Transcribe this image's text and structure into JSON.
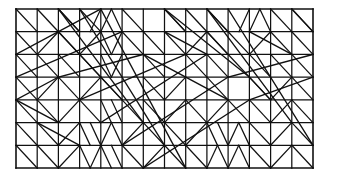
{
  "figure": {
    "type": "mesh-diagram"
  },
  "canvas": {
    "width": 338,
    "height": 179,
    "background": "#ffffff"
  },
  "style": {
    "line_color": "#111111",
    "border_color": "#111111",
    "border_width": 1.6,
    "grid_width": 1.25,
    "diagonal_width": 1.25,
    "chord_width": 1.35
  },
  "domain": {
    "x0": 16,
    "y0": 9,
    "x1": 313,
    "y1": 168,
    "columns": 14,
    "rows": 7,
    "cell_width": 21.21,
    "cell_height": 22.71
  },
  "grid": {
    "vertical_x": [
      16,
      37.2,
      58.4,
      79.6,
      100.8,
      122.1,
      143.3,
      164.5,
      185.7,
      206.9,
      228.1,
      249.4,
      270.6,
      291.8,
      313
    ],
    "horizontal_y": [
      9,
      31.7,
      54.4,
      77.1,
      99.9,
      122.6,
      145.3,
      168
    ]
  },
  "chart_data": {
    "type": "diagram",
    "node_count": 120,
    "cell_count": 98,
    "segments": {
      "border": [
        {
          "x1": 16,
          "y1": 9,
          "x2": 313,
          "y2": 9
        },
        {
          "x1": 313,
          "y1": 9,
          "x2": 313,
          "y2": 168
        },
        {
          "x1": 313,
          "y1": 168,
          "x2": 16,
          "y2": 168
        },
        {
          "x1": 16,
          "y1": 168,
          "x2": 16,
          "y2": 9
        }
      ],
      "grid_vertical": [
        {
          "x1": 37.2,
          "y1": 9,
          "x2": 37.2,
          "y2": 168
        },
        {
          "x1": 58.4,
          "y1": 9,
          "x2": 58.4,
          "y2": 168
        },
        {
          "x1": 79.6,
          "y1": 9,
          "x2": 79.6,
          "y2": 168
        },
        {
          "x1": 100.8,
          "y1": 9,
          "x2": 100.8,
          "y2": 168
        },
        {
          "x1": 122.1,
          "y1": 9,
          "x2": 122.1,
          "y2": 168
        },
        {
          "x1": 143.3,
          "y1": 9,
          "x2": 143.3,
          "y2": 168
        },
        {
          "x1": 164.5,
          "y1": 9,
          "x2": 164.5,
          "y2": 168
        },
        {
          "x1": 185.7,
          "y1": 9,
          "x2": 185.7,
          "y2": 168
        },
        {
          "x1": 206.9,
          "y1": 9,
          "x2": 206.9,
          "y2": 168
        },
        {
          "x1": 228.1,
          "y1": 9,
          "x2": 228.1,
          "y2": 168
        },
        {
          "x1": 249.4,
          "y1": 9,
          "x2": 249.4,
          "y2": 168
        },
        {
          "x1": 270.6,
          "y1": 9,
          "x2": 270.6,
          "y2": 168
        },
        {
          "x1": 291.8,
          "y1": 9,
          "x2": 291.8,
          "y2": 168
        }
      ],
      "grid_horizontal": [
        {
          "x1": 16,
          "y1": 31.7,
          "x2": 313,
          "y2": 31.7
        },
        {
          "x1": 16,
          "y1": 54.4,
          "x2": 313,
          "y2": 54.4
        },
        {
          "x1": 16,
          "y1": 77.1,
          "x2": 313,
          "y2": 77.1
        },
        {
          "x1": 16,
          "y1": 99.9,
          "x2": 313,
          "y2": 99.9
        },
        {
          "x1": 16,
          "y1": 122.6,
          "x2": 313,
          "y2": 122.6
        },
        {
          "x1": 16,
          "y1": 145.3,
          "x2": 313,
          "y2": 145.3
        }
      ],
      "cell_diagonals": [
        {
          "x1": 16,
          "y1": 9,
          "x2": 37.2,
          "y2": 31.7
        },
        {
          "x1": 58.4,
          "y1": 9,
          "x2": 79.6,
          "y2": 31.7
        },
        {
          "x1": 79.6,
          "y1": 31.7,
          "x2": 58.4,
          "y2": 9
        },
        {
          "x1": 79.6,
          "y1": 9,
          "x2": 100.8,
          "y2": 31.7
        },
        {
          "x1": 100.8,
          "y1": 9,
          "x2": 90.2,
          "y2": 31.7
        },
        {
          "x1": 100.8,
          "y1": 31.7,
          "x2": 111.4,
          "y2": 9
        },
        {
          "x1": 111.4,
          "y1": 9,
          "x2": 122.1,
          "y2": 31.7
        },
        {
          "x1": 122.1,
          "y1": 9,
          "x2": 143.3,
          "y2": 31.7
        },
        {
          "x1": 164.5,
          "y1": 9,
          "x2": 185.7,
          "y2": 31.7
        },
        {
          "x1": 185.7,
          "y1": 31.7,
          "x2": 164.5,
          "y2": 9
        },
        {
          "x1": 206.9,
          "y1": 9,
          "x2": 228.1,
          "y2": 31.7
        },
        {
          "x1": 228.1,
          "y1": 31.7,
          "x2": 206.9,
          "y2": 9
        },
        {
          "x1": 249.4,
          "y1": 9,
          "x2": 239,
          "y2": 31.7
        },
        {
          "x1": 249.4,
          "y1": 31.7,
          "x2": 259.8,
          "y2": 9
        },
        {
          "x1": 259.8,
          "y1": 9,
          "x2": 270.6,
          "y2": 31.7
        },
        {
          "x1": 270.6,
          "y1": 9,
          "x2": 291.8,
          "y2": 31.7
        },
        {
          "x1": 291.8,
          "y1": 9,
          "x2": 313,
          "y2": 31.7
        },
        {
          "x1": 313,
          "y1": 31.7,
          "x2": 291.8,
          "y2": 9
        },
        {
          "x1": 16,
          "y1": 31.7,
          "x2": 37.2,
          "y2": 54.4
        },
        {
          "x1": 37.2,
          "y1": 54.4,
          "x2": 58.4,
          "y2": 31.7
        },
        {
          "x1": 58.4,
          "y1": 31.7,
          "x2": 79.6,
          "y2": 54.4
        },
        {
          "x1": 79.6,
          "y1": 54.4,
          "x2": 100.8,
          "y2": 31.7
        },
        {
          "x1": 100.8,
          "y1": 31.7,
          "x2": 111.4,
          "y2": 54.4
        },
        {
          "x1": 111.4,
          "y1": 54.4,
          "x2": 122.1,
          "y2": 31.7
        },
        {
          "x1": 122.1,
          "y1": 31.7,
          "x2": 143.3,
          "y2": 54.4
        },
        {
          "x1": 143.3,
          "y1": 31.7,
          "x2": 164.5,
          "y2": 54.4
        },
        {
          "x1": 164.5,
          "y1": 31.7,
          "x2": 185.7,
          "y2": 54.4
        },
        {
          "x1": 185.7,
          "y1": 54.4,
          "x2": 206.9,
          "y2": 31.7
        },
        {
          "x1": 206.9,
          "y1": 31.7,
          "x2": 228.1,
          "y2": 54.4
        },
        {
          "x1": 228.1,
          "y1": 31.7,
          "x2": 249.4,
          "y2": 54.4
        },
        {
          "x1": 249.4,
          "y1": 54.4,
          "x2": 270.6,
          "y2": 31.7
        },
        {
          "x1": 270.6,
          "y1": 31.7,
          "x2": 291.8,
          "y2": 54.4
        },
        {
          "x1": 291.8,
          "y1": 31.7,
          "x2": 313,
          "y2": 54.4
        },
        {
          "x1": 16,
          "y1": 54.4,
          "x2": 37.2,
          "y2": 77.1
        },
        {
          "x1": 37.2,
          "y1": 54.4,
          "x2": 58.4,
          "y2": 77.1
        },
        {
          "x1": 58.4,
          "y1": 54.4,
          "x2": 79.6,
          "y2": 77.1
        },
        {
          "x1": 79.6,
          "y1": 54.4,
          "x2": 100.8,
          "y2": 77.1
        },
        {
          "x1": 100.8,
          "y1": 54.4,
          "x2": 111.4,
          "y2": 77.1
        },
        {
          "x1": 111.4,
          "y1": 77.1,
          "x2": 122.1,
          "y2": 54.4
        },
        {
          "x1": 143.3,
          "y1": 54.4,
          "x2": 164.5,
          "y2": 77.1
        },
        {
          "x1": 185.7,
          "y1": 54.4,
          "x2": 206.9,
          "y2": 77.1
        },
        {
          "x1": 206.9,
          "y1": 54.4,
          "x2": 228.1,
          "y2": 77.1
        },
        {
          "x1": 249.4,
          "y1": 54.4,
          "x2": 270.6,
          "y2": 77.1
        },
        {
          "x1": 270.6,
          "y1": 54.4,
          "x2": 291.8,
          "y2": 77.1
        },
        {
          "x1": 291.8,
          "y1": 54.4,
          "x2": 313,
          "y2": 77.1
        },
        {
          "x1": 16,
          "y1": 77.1,
          "x2": 37.2,
          "y2": 99.9
        },
        {
          "x1": 37.2,
          "y1": 99.9,
          "x2": 58.4,
          "y2": 77.1
        },
        {
          "x1": 58.4,
          "y1": 77.1,
          "x2": 79.6,
          "y2": 99.9
        },
        {
          "x1": 79.6,
          "y1": 99.9,
          "x2": 100.8,
          "y2": 77.1
        },
        {
          "x1": 100.8,
          "y1": 77.1,
          "x2": 122.1,
          "y2": 99.9
        },
        {
          "x1": 143.3,
          "y1": 77.1,
          "x2": 164.5,
          "y2": 99.9
        },
        {
          "x1": 164.5,
          "y1": 99.9,
          "x2": 185.7,
          "y2": 77.1
        },
        {
          "x1": 206.9,
          "y1": 77.1,
          "x2": 228.1,
          "y2": 99.9
        },
        {
          "x1": 249.4,
          "y1": 77.1,
          "x2": 270.6,
          "y2": 99.9
        },
        {
          "x1": 270.6,
          "y1": 99.9,
          "x2": 291.8,
          "y2": 77.1
        },
        {
          "x1": 291.8,
          "y1": 77.1,
          "x2": 313,
          "y2": 99.9
        },
        {
          "x1": 16,
          "y1": 99.9,
          "x2": 37.2,
          "y2": 122.6
        },
        {
          "x1": 37.2,
          "y1": 99.9,
          "x2": 58.4,
          "y2": 122.6
        },
        {
          "x1": 58.4,
          "y1": 122.6,
          "x2": 79.6,
          "y2": 99.9
        },
        {
          "x1": 79.6,
          "y1": 99.9,
          "x2": 100.8,
          "y2": 122.6
        },
        {
          "x1": 100.8,
          "y1": 99.9,
          "x2": 111.4,
          "y2": 122.6
        },
        {
          "x1": 111.4,
          "y1": 99.9,
          "x2": 122.1,
          "y2": 122.6
        },
        {
          "x1": 122.1,
          "y1": 99.9,
          "x2": 143.3,
          "y2": 122.6
        },
        {
          "x1": 143.3,
          "y1": 99.9,
          "x2": 164.5,
          "y2": 122.6
        },
        {
          "x1": 164.5,
          "y1": 122.6,
          "x2": 185.7,
          "y2": 99.9
        },
        {
          "x1": 185.7,
          "y1": 99.9,
          "x2": 206.9,
          "y2": 122.6
        },
        {
          "x1": 206.9,
          "y1": 122.6,
          "x2": 228.1,
          "y2": 99.9
        },
        {
          "x1": 228.1,
          "y1": 99.9,
          "x2": 249.4,
          "y2": 122.6
        },
        {
          "x1": 249.4,
          "y1": 99.9,
          "x2": 270.6,
          "y2": 122.6
        },
        {
          "x1": 270.6,
          "y1": 122.6,
          "x2": 291.8,
          "y2": 99.9
        },
        {
          "x1": 291.8,
          "y1": 99.9,
          "x2": 313,
          "y2": 122.6
        },
        {
          "x1": 16,
          "y1": 122.6,
          "x2": 37.2,
          "y2": 145.3
        },
        {
          "x1": 37.2,
          "y1": 122.6,
          "x2": 58.4,
          "y2": 145.3
        },
        {
          "x1": 58.4,
          "y1": 145.3,
          "x2": 79.6,
          "y2": 122.6
        },
        {
          "x1": 79.6,
          "y1": 122.6,
          "x2": 90.2,
          "y2": 145.3
        },
        {
          "x1": 90.2,
          "y1": 122.6,
          "x2": 100.8,
          "y2": 145.3
        },
        {
          "x1": 100.8,
          "y1": 145.3,
          "x2": 111.4,
          "y2": 122.6
        },
        {
          "x1": 111.4,
          "y1": 122.6,
          "x2": 122.1,
          "y2": 145.3
        },
        {
          "x1": 122.1,
          "y1": 145.3,
          "x2": 143.3,
          "y2": 122.6
        },
        {
          "x1": 143.3,
          "y1": 122.6,
          "x2": 164.5,
          "y2": 145.3
        },
        {
          "x1": 164.5,
          "y1": 122.6,
          "x2": 185.7,
          "y2": 145.3
        },
        {
          "x1": 185.7,
          "y1": 145.3,
          "x2": 206.9,
          "y2": 122.6
        },
        {
          "x1": 206.9,
          "y1": 122.6,
          "x2": 217.5,
          "y2": 145.3
        },
        {
          "x1": 217.5,
          "y1": 122.6,
          "x2": 228.1,
          "y2": 145.3
        },
        {
          "x1": 228.1,
          "y1": 145.3,
          "x2": 238.7,
          "y2": 122.6
        },
        {
          "x1": 238.7,
          "y1": 122.6,
          "x2": 249.4,
          "y2": 145.3
        },
        {
          "x1": 249.4,
          "y1": 122.6,
          "x2": 270.6,
          "y2": 145.3
        },
        {
          "x1": 270.6,
          "y1": 145.3,
          "x2": 291.8,
          "y2": 122.6
        },
        {
          "x1": 291.8,
          "y1": 122.6,
          "x2": 313,
          "y2": 145.3
        },
        {
          "x1": 16,
          "y1": 145.3,
          "x2": 37.2,
          "y2": 168
        },
        {
          "x1": 37.2,
          "y1": 145.3,
          "x2": 58.4,
          "y2": 168
        },
        {
          "x1": 58.4,
          "y1": 168,
          "x2": 79.6,
          "y2": 145.3
        },
        {
          "x1": 79.6,
          "y1": 145.3,
          "x2": 90.2,
          "y2": 168
        },
        {
          "x1": 90.2,
          "y1": 168,
          "x2": 100.8,
          "y2": 145.3
        },
        {
          "x1": 100.8,
          "y1": 145.3,
          "x2": 111.4,
          "y2": 168
        },
        {
          "x1": 111.4,
          "y1": 145.3,
          "x2": 122.1,
          "y2": 168
        },
        {
          "x1": 122.1,
          "y1": 145.3,
          "x2": 143.3,
          "y2": 168
        },
        {
          "x1": 143.3,
          "y1": 168,
          "x2": 164.5,
          "y2": 145.3
        },
        {
          "x1": 164.5,
          "y1": 145.3,
          "x2": 185.7,
          "y2": 168
        },
        {
          "x1": 185.7,
          "y1": 145.3,
          "x2": 206.9,
          "y2": 168
        },
        {
          "x1": 206.9,
          "y1": 168,
          "x2": 217.5,
          "y2": 145.3
        },
        {
          "x1": 217.5,
          "y1": 145.3,
          "x2": 228.1,
          "y2": 168
        },
        {
          "x1": 228.1,
          "y1": 168,
          "x2": 238.7,
          "y2": 145.3
        },
        {
          "x1": 238.7,
          "y1": 145.3,
          "x2": 249.4,
          "y2": 168
        },
        {
          "x1": 249.4,
          "y1": 145.3,
          "x2": 270.6,
          "y2": 168
        },
        {
          "x1": 270.6,
          "y1": 168,
          "x2": 291.8,
          "y2": 145.3
        },
        {
          "x1": 291.8,
          "y1": 145.3,
          "x2": 313,
          "y2": 168
        }
      ],
      "long_chords": [
        {
          "x1": 16,
          "y1": 54.4,
          "x2": 100.8,
          "y2": 9
        },
        {
          "x1": 16,
          "y1": 77.1,
          "x2": 122.1,
          "y2": 31.7
        },
        {
          "x1": 16,
          "y1": 99.9,
          "x2": 58.4,
          "y2": 77.1
        },
        {
          "x1": 37.2,
          "y1": 9,
          "x2": 122.1,
          "y2": 99.9
        },
        {
          "x1": 58.4,
          "y1": 9,
          "x2": 143.3,
          "y2": 122.6
        },
        {
          "x1": 79.6,
          "y1": 9,
          "x2": 164.5,
          "y2": 145.3
        },
        {
          "x1": 100.8,
          "y1": 9,
          "x2": 185.7,
          "y2": 168
        },
        {
          "x1": 58.4,
          "y1": 77.1,
          "x2": 143.3,
          "y2": 54.4
        },
        {
          "x1": 79.6,
          "y1": 99.9,
          "x2": 185.7,
          "y2": 54.4
        },
        {
          "x1": 100.8,
          "y1": 122.6,
          "x2": 206.9,
          "y2": 54.4
        },
        {
          "x1": 122.1,
          "y1": 145.3,
          "x2": 228.1,
          "y2": 77.1
        },
        {
          "x1": 143.3,
          "y1": 168,
          "x2": 249.4,
          "y2": 99.9
        },
        {
          "x1": 164.5,
          "y1": 9,
          "x2": 249.4,
          "y2": 77.1
        },
        {
          "x1": 185.7,
          "y1": 9,
          "x2": 270.6,
          "y2": 99.9
        },
        {
          "x1": 206.9,
          "y1": 9,
          "x2": 291.8,
          "y2": 122.6
        },
        {
          "x1": 228.1,
          "y1": 9,
          "x2": 313,
          "y2": 145.3
        },
        {
          "x1": 228.1,
          "y1": 77.1,
          "x2": 313,
          "y2": 54.4
        },
        {
          "x1": 249.4,
          "y1": 99.9,
          "x2": 313,
          "y2": 77.1
        },
        {
          "x1": 143.3,
          "y1": 54.4,
          "x2": 228.1,
          "y2": 99.9
        },
        {
          "x1": 164.5,
          "y1": 31.7,
          "x2": 206.9,
          "y2": 54.4
        },
        {
          "x1": 249.4,
          "y1": 31.7,
          "x2": 291.8,
          "y2": 54.4
        },
        {
          "x1": 37.2,
          "y1": 122.6,
          "x2": 79.6,
          "y2": 145.3
        },
        {
          "x1": 16,
          "y1": 99.9,
          "x2": 58.4,
          "y2": 122.6
        }
      ]
    }
  }
}
